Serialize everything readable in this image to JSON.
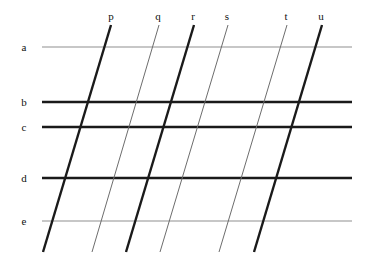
{
  "figure": {
    "name": "slanted-grid-diagram",
    "width": 366,
    "height": 267,
    "background": "#ffffff"
  },
  "colors": {
    "thick_line": "#1a1a1a",
    "thin_line": "#8a8a8a",
    "medium_line": "#4a4a4a",
    "label_text": "#111111"
  },
  "horizontal_lines": [
    {
      "label": "a",
      "y": 47,
      "x1": 42,
      "x2": 352,
      "weight": "thin",
      "color": "#8f8f8f",
      "stroke_width": 1.0,
      "label_x": 24,
      "label_y": 47
    },
    {
      "label": "b",
      "y": 102,
      "x1": 42,
      "x2": 352,
      "weight": "thick",
      "color": "#1a1a1a",
      "stroke_width": 2.4,
      "label_x": 24,
      "label_y": 102
    },
    {
      "label": "c",
      "y": 127,
      "x1": 42,
      "x2": 352,
      "weight": "thick",
      "color": "#1a1a1a",
      "stroke_width": 2.4,
      "label_x": 24,
      "label_y": 127
    },
    {
      "label": "d",
      "y": 178,
      "x1": 42,
      "x2": 352,
      "weight": "thick",
      "color": "#1a1a1a",
      "stroke_width": 2.4,
      "label_x": 24,
      "label_y": 178
    },
    {
      "label": "e",
      "y": 221,
      "x1": 42,
      "x2": 352,
      "weight": "thin",
      "color": "#8f8f8f",
      "stroke_width": 1.0,
      "label_x": 24,
      "label_y": 221
    }
  ],
  "slanted_lines": [
    {
      "label": "p",
      "x_top": 111,
      "y_top": 25,
      "x_bottom": 43,
      "y_bottom": 252,
      "weight": "thick",
      "color": "#1a1a1a",
      "stroke_width": 2.4,
      "label_x": 111,
      "label_y": 22
    },
    {
      "label": "q",
      "x_top": 159,
      "y_top": 25,
      "x_bottom": 92,
      "y_bottom": 252,
      "weight": "thin",
      "color": "#6d6d6d",
      "stroke_width": 1.0,
      "label_x": 158,
      "label_y": 22
    },
    {
      "label": "r",
      "x_top": 194,
      "y_top": 25,
      "x_bottom": 126,
      "y_bottom": 252,
      "weight": "thick",
      "color": "#1a1a1a",
      "stroke_width": 2.4,
      "label_x": 193,
      "label_y": 22
    },
    {
      "label": "s",
      "x_top": 228,
      "y_top": 25,
      "x_bottom": 160,
      "y_bottom": 252,
      "weight": "thin",
      "color": "#6d6d6d",
      "stroke_width": 1.0,
      "label_x": 227,
      "label_y": 22
    },
    {
      "label": "t",
      "x_top": 287,
      "y_top": 25,
      "x_bottom": 219,
      "y_bottom": 252,
      "weight": "thin",
      "color": "#6d6d6d",
      "stroke_width": 1.0,
      "label_x": 286,
      "label_y": 22
    },
    {
      "label": "u",
      "x_top": 322,
      "y_top": 25,
      "x_bottom": 254,
      "y_bottom": 252,
      "weight": "thick",
      "color": "#1a1a1a",
      "stroke_width": 2.4,
      "label_x": 321,
      "label_y": 22
    }
  ]
}
